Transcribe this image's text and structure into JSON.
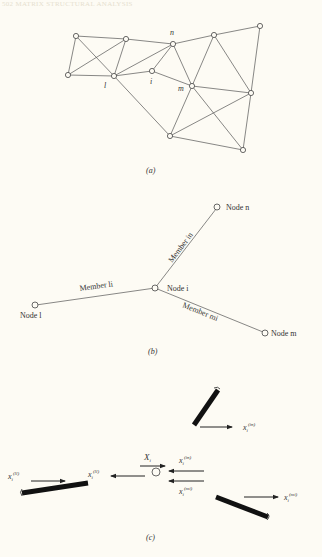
{
  "header": {
    "running_head": "502 MATRIX STRUCTURAL ANALYSIS"
  },
  "panel_a": {
    "caption": "(a)",
    "node_labels": {
      "n": "n",
      "l": "l",
      "i": "i",
      "m": "m"
    }
  },
  "panel_b": {
    "caption": "(b)",
    "nodes": {
      "n": "Node n",
      "i": "Node i",
      "l": "Node l",
      "m": "Node m"
    },
    "members": {
      "in": "Member in",
      "li": "Member li",
      "mi": "Member mi"
    }
  },
  "panel_c": {
    "caption": "(c)",
    "forces": {
      "X_i": "X",
      "X_i_sub": "i",
      "x_in_top": "x",
      "x_in_top_sub": "i",
      "x_in_top_sup": "(in)",
      "x_ll_left": "x",
      "x_ll_left_sub": "i",
      "x_ll_left_sup": "(ll)",
      "x_ll_center": "x",
      "x_ll_center_sub": "i",
      "x_ll_center_sup": "(ll)",
      "x_in_center": "x",
      "x_in_center_sub": "i",
      "x_in_center_sup": "(in)",
      "x_mi_center": "x",
      "x_mi_center_sub": "i",
      "x_mi_center_sup": "(mi)",
      "x_mi_right": "x",
      "x_mi_right_sub": "i",
      "x_mi_right_sup": "(mi)"
    }
  }
}
